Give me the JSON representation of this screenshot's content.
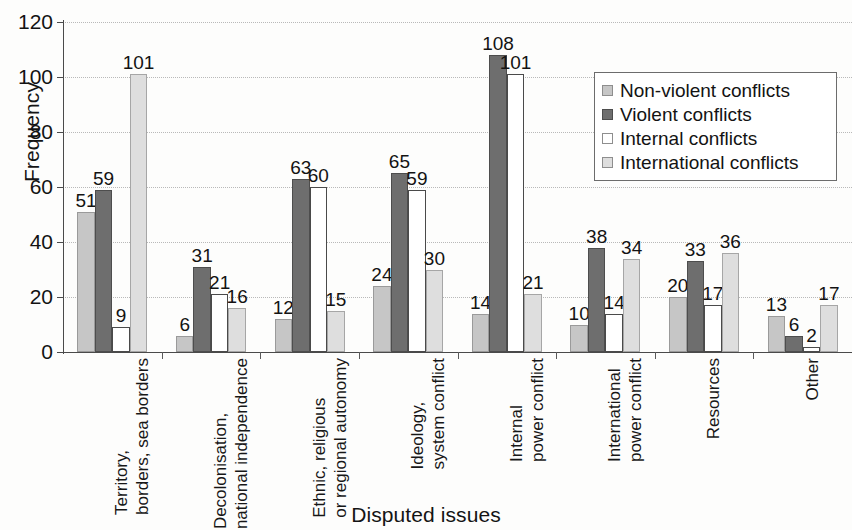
{
  "chart_data": {
    "type": "bar",
    "title": "",
    "xlabel": "Disputed issues",
    "ylabel": "Frequency",
    "ylim": [
      0,
      120
    ],
    "ytick_step": 20,
    "yticks": [
      0,
      20,
      40,
      60,
      80,
      100,
      120
    ],
    "grid": true,
    "legend_position": "upper right",
    "categories": [
      "Territory, borders, sea borders",
      "Decolonisation, national independence",
      "Ethnic, religious or regional autonomy",
      "Ideology, system conflict",
      "Internal power conflict",
      "International power conflict",
      "Resources",
      "Other"
    ],
    "category_lines": [
      [
        "Territory,",
        "borders, sea borders"
      ],
      [
        "Decolonisation,",
        "national independence"
      ],
      [
        "Ethnic, religious",
        "or regional autonomy"
      ],
      [
        "Ideology,",
        "system conflict"
      ],
      [
        "Internal",
        "power conflict"
      ],
      [
        "International",
        "power conflict"
      ],
      [
        "Resources",
        ""
      ],
      [
        "Other",
        ""
      ]
    ],
    "series": [
      {
        "name": "Non-violent conflicts",
        "color": "#c6c6c6",
        "values": [
          51,
          6,
          12,
          24,
          14,
          10,
          20,
          13
        ]
      },
      {
        "name": "Violent conflicts",
        "color": "#6e6e6e",
        "values": [
          59,
          31,
          63,
          65,
          108,
          38,
          33,
          6
        ]
      },
      {
        "name": "Internal conflicts",
        "color": "#ffffff",
        "values": [
          9,
          21,
          60,
          59,
          101,
          14,
          17,
          2
        ]
      },
      {
        "name": "International conflicts",
        "color": "#dedede",
        "values": [
          101,
          16,
          15,
          30,
          21,
          34,
          36,
          17
        ]
      }
    ]
  },
  "legend": {
    "items": [
      {
        "label": "Non-violent conflicts"
      },
      {
        "label": "Violent conflicts"
      },
      {
        "label": "Internal conflicts"
      },
      {
        "label": "International conflicts"
      }
    ]
  },
  "axes": {
    "y_title": "Frequency",
    "x_title": "Disputed issues"
  }
}
